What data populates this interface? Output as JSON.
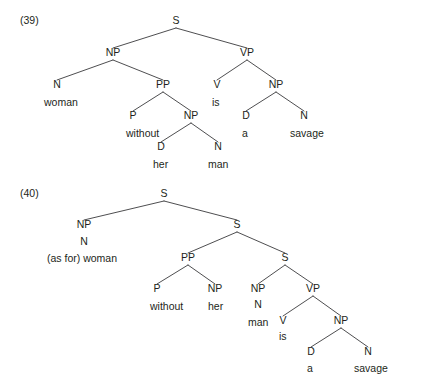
{
  "figure": {
    "background_color": "#ffffff",
    "ink_color": "#231f20",
    "line_color": "#3a3a3c",
    "width": 422,
    "height": 384
  },
  "examples": [
    {
      "id": "example-39",
      "number": "(39)",
      "number_x": 20,
      "number_y": 24,
      "sentence": "woman without her man is a savage",
      "nodes": [
        {
          "name": "s-root",
          "label": "S",
          "x": 176,
          "y": 24,
          "anchor": "middle"
        },
        {
          "name": "np-subject",
          "label": "NP",
          "x": 113,
          "y": 56,
          "anchor": "middle"
        },
        {
          "name": "vp-predicate",
          "label": "VP",
          "x": 247,
          "y": 56,
          "anchor": "middle"
        },
        {
          "name": "n-woman",
          "label": "N",
          "x": 57,
          "y": 88,
          "anchor": "middle"
        },
        {
          "name": "pp-without",
          "label": "PP",
          "x": 163,
          "y": 88,
          "anchor": "middle"
        },
        {
          "name": "v-is",
          "label": "V",
          "x": 217,
          "y": 88,
          "anchor": "middle"
        },
        {
          "name": "np-object",
          "label": "NP",
          "x": 276,
          "y": 88,
          "anchor": "middle"
        },
        {
          "name": "p-without",
          "label": "P",
          "x": 133,
          "y": 119,
          "anchor": "middle"
        },
        {
          "name": "np-her-man",
          "label": "NP",
          "x": 191,
          "y": 119,
          "anchor": "middle"
        },
        {
          "name": "d-a",
          "label": "D",
          "x": 246,
          "y": 119,
          "anchor": "middle"
        },
        {
          "name": "n-savage",
          "label": "N",
          "x": 304,
          "y": 119,
          "anchor": "middle"
        },
        {
          "name": "d-her",
          "label": "D",
          "x": 161,
          "y": 150,
          "anchor": "middle"
        },
        {
          "name": "n-man",
          "label": "N",
          "x": 218,
          "y": 150,
          "anchor": "middle"
        }
      ],
      "terminals": [
        {
          "name": "terminal-woman",
          "label": "woman",
          "x": 44,
          "y": 106,
          "anchor": "start"
        },
        {
          "name": "terminal-is",
          "label": "is",
          "x": 212,
          "y": 106,
          "anchor": "start"
        },
        {
          "name": "terminal-without",
          "label": "without",
          "x": 126,
          "y": 137,
          "anchor": "start"
        },
        {
          "name": "terminal-a",
          "label": "a",
          "x": 242,
          "y": 137,
          "anchor": "start"
        },
        {
          "name": "terminal-savage",
          "label": "savage",
          "x": 290,
          "y": 137,
          "anchor": "start"
        },
        {
          "name": "terminal-her",
          "label": "her",
          "x": 153,
          "y": 168,
          "anchor": "start"
        },
        {
          "name": "terminal-man",
          "label": "man",
          "x": 208,
          "y": 168,
          "anchor": "start"
        }
      ],
      "branches": [
        {
          "name": "branch-s-np",
          "x1": 176,
          "y1": 28,
          "x2": 113,
          "y2": 48
        },
        {
          "name": "branch-s-vp",
          "x1": 176,
          "y1": 28,
          "x2": 247,
          "y2": 48
        },
        {
          "name": "branch-np-n",
          "x1": 113,
          "y1": 60,
          "x2": 57,
          "y2": 80
        },
        {
          "name": "branch-np-pp",
          "x1": 113,
          "y1": 60,
          "x2": 163,
          "y2": 80
        },
        {
          "name": "branch-vp-v",
          "x1": 247,
          "y1": 60,
          "x2": 217,
          "y2": 80
        },
        {
          "name": "branch-vp-np",
          "x1": 247,
          "y1": 60,
          "x2": 276,
          "y2": 80
        },
        {
          "name": "branch-pp-p",
          "x1": 163,
          "y1": 92,
          "x2": 133,
          "y2": 111
        },
        {
          "name": "branch-pp-np",
          "x1": 163,
          "y1": 92,
          "x2": 191,
          "y2": 111
        },
        {
          "name": "branch-npobj-d",
          "x1": 276,
          "y1": 92,
          "x2": 246,
          "y2": 111
        },
        {
          "name": "branch-npobj-n",
          "x1": 276,
          "y1": 92,
          "x2": 304,
          "y2": 111
        },
        {
          "name": "branch-nphermn-d",
          "x1": 191,
          "y1": 123,
          "x2": 161,
          "y2": 142
        },
        {
          "name": "branch-nphermn-n",
          "x1": 191,
          "y1": 123,
          "x2": 218,
          "y2": 142
        }
      ]
    },
    {
      "id": "example-40",
      "number": "(40)",
      "number_x": 20,
      "number_y": 197,
      "sentence": "(as for) woman without her man is a savage",
      "nodes": [
        {
          "name": "s-root-40",
          "label": "S",
          "x": 164,
          "y": 197,
          "anchor": "middle"
        },
        {
          "name": "np-topic-40",
          "label": "NP",
          "x": 84,
          "y": 228,
          "anchor": "middle"
        },
        {
          "name": "s-mid-40",
          "label": "S",
          "x": 237,
          "y": 228,
          "anchor": "middle"
        },
        {
          "name": "n-topic-40",
          "label": "N",
          "x": 84,
          "y": 245,
          "anchor": "middle"
        },
        {
          "name": "pp-without-40",
          "label": "PP",
          "x": 188,
          "y": 261,
          "anchor": "middle"
        },
        {
          "name": "s-lower-40",
          "label": "S",
          "x": 285,
          "y": 261,
          "anchor": "middle"
        },
        {
          "name": "p-without-40",
          "label": "P",
          "x": 157,
          "y": 292,
          "anchor": "middle"
        },
        {
          "name": "np-her-40",
          "label": "NP",
          "x": 215,
          "y": 292,
          "anchor": "middle"
        },
        {
          "name": "np-man-40",
          "label": "NP",
          "x": 258,
          "y": 292,
          "anchor": "middle"
        },
        {
          "name": "vp-40",
          "label": "VP",
          "x": 313,
          "y": 292,
          "anchor": "middle"
        },
        {
          "name": "n-man-40",
          "label": "N",
          "x": 258,
          "y": 308,
          "anchor": "middle"
        },
        {
          "name": "v-is-40",
          "label": "V",
          "x": 283,
          "y": 324,
          "anchor": "middle"
        },
        {
          "name": "np-object-40",
          "label": "NP",
          "x": 341,
          "y": 324,
          "anchor": "middle"
        },
        {
          "name": "d-a-40",
          "label": "D",
          "x": 311,
          "y": 355,
          "anchor": "middle"
        },
        {
          "name": "n-savage-40",
          "label": "N",
          "x": 368,
          "y": 355,
          "anchor": "middle"
        }
      ],
      "terminals": [
        {
          "name": "terminal-as-for-woman",
          "label": "(as for) woman",
          "x": 47,
          "y": 262,
          "anchor": "start"
        },
        {
          "name": "terminal-without-40",
          "label": "without",
          "x": 150,
          "y": 310,
          "anchor": "start"
        },
        {
          "name": "terminal-her-40",
          "label": "her",
          "x": 208,
          "y": 310,
          "anchor": "start"
        },
        {
          "name": "terminal-man-40",
          "label": "man",
          "x": 248,
          "y": 326,
          "anchor": "start"
        },
        {
          "name": "terminal-is-40",
          "label": "is",
          "x": 279,
          "y": 340,
          "anchor": "start"
        },
        {
          "name": "terminal-a-40",
          "label": "a",
          "x": 307,
          "y": 372,
          "anchor": "start"
        },
        {
          "name": "terminal-savage-40",
          "label": "savage",
          "x": 354,
          "y": 372,
          "anchor": "start"
        }
      ],
      "branches": [
        {
          "name": "branch40-s-np",
          "x1": 164,
          "y1": 201,
          "x2": 84,
          "y2": 220
        },
        {
          "name": "branch40-s-smid",
          "x1": 164,
          "y1": 201,
          "x2": 237,
          "y2": 220
        },
        {
          "name": "branch40-smid-pp",
          "x1": 237,
          "y1": 232,
          "x2": 188,
          "y2": 253
        },
        {
          "name": "branch40-smid-slow",
          "x1": 237,
          "y1": 232,
          "x2": 285,
          "y2": 253
        },
        {
          "name": "branch40-pp-p",
          "x1": 188,
          "y1": 265,
          "x2": 157,
          "y2": 284
        },
        {
          "name": "branch40-pp-np",
          "x1": 188,
          "y1": 265,
          "x2": 215,
          "y2": 284
        },
        {
          "name": "branch40-slow-np",
          "x1": 285,
          "y1": 265,
          "x2": 258,
          "y2": 284
        },
        {
          "name": "branch40-slow-vp",
          "x1": 285,
          "y1": 265,
          "x2": 313,
          "y2": 284
        },
        {
          "name": "branch40-vp-v",
          "x1": 313,
          "y1": 296,
          "x2": 283,
          "y2": 316
        },
        {
          "name": "branch40-vp-np",
          "x1": 313,
          "y1": 296,
          "x2": 341,
          "y2": 316
        },
        {
          "name": "branch40-np-d",
          "x1": 341,
          "y1": 328,
          "x2": 311,
          "y2": 347
        },
        {
          "name": "branch40-np-n",
          "x1": 341,
          "y1": 328,
          "x2": 368,
          "y2": 347
        }
      ]
    }
  ]
}
